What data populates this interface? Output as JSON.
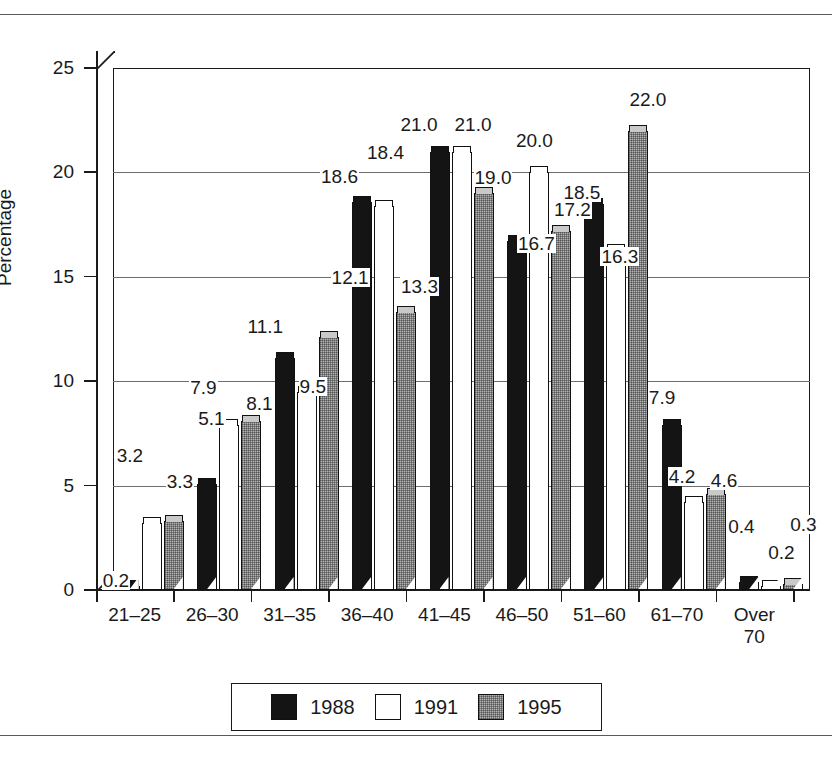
{
  "chart_data": {
    "type": "bar",
    "title": "",
    "xlabel": "Age in Years",
    "ylabel": "Percentage",
    "ylim": [
      0,
      25
    ],
    "yticks": [
      "0",
      "5",
      "10",
      "15",
      "20",
      "25"
    ],
    "grid": true,
    "legend_position": "bottom",
    "categories": [
      "21–25",
      "26–30",
      "31–35",
      "36–40",
      "41–45",
      "46–50",
      "51–60",
      "61–70",
      "Over\n70"
    ],
    "series": [
      {
        "name": "1988",
        "color": "#141414",
        "values": [
          0.2,
          5.1,
          11.1,
          18.6,
          21.0,
          16.7,
          18.5,
          7.9,
          0.4
        ]
      },
      {
        "name": "1991",
        "color": "#ffffff",
        "values": [
          3.2,
          7.9,
          9.5,
          18.4,
          21.0,
          20.0,
          16.3,
          4.2,
          0.2
        ]
      },
      {
        "name": "1995",
        "color": "#b3b3b3",
        "values": [
          3.3,
          8.1,
          12.1,
          13.3,
          19.0,
          17.2,
          22.0,
          4.6,
          0.3
        ]
      }
    ],
    "data_labels": [
      [
        "0.2",
        "3.2",
        "3.3"
      ],
      [
        "5.1",
        "7.9",
        "8.1"
      ],
      [
        "11.1",
        "9.5",
        "12.1"
      ],
      [
        "18.6",
        "18.4",
        "13.3"
      ],
      [
        "21.0",
        "21.0",
        "19.0"
      ],
      [
        "16.7",
        "20.0",
        "17.2"
      ],
      [
        "18.5",
        "16.3",
        "22.0"
      ],
      [
        "7.9",
        "4.2",
        "4.6"
      ],
      [
        "0.4",
        "0.2",
        "0.3"
      ]
    ]
  },
  "axis": {
    "y_title": "Percentage",
    "x_title": "Age in Years",
    "y_ticks": [
      "25",
      "20",
      "15",
      "10",
      "5",
      "0"
    ],
    "x_labels": [
      "21–25",
      "26–30",
      "31–35",
      "36–40",
      "41–45",
      "46–50",
      "51–60",
      "61–70",
      "Over 70"
    ]
  },
  "legend": {
    "entries": [
      {
        "label": "1988",
        "swatch": "black-filled-swatch"
      },
      {
        "label": "1991",
        "swatch": "white-empty-swatch"
      },
      {
        "label": "1995",
        "swatch": "gray-hatched-swatch"
      }
    ]
  }
}
